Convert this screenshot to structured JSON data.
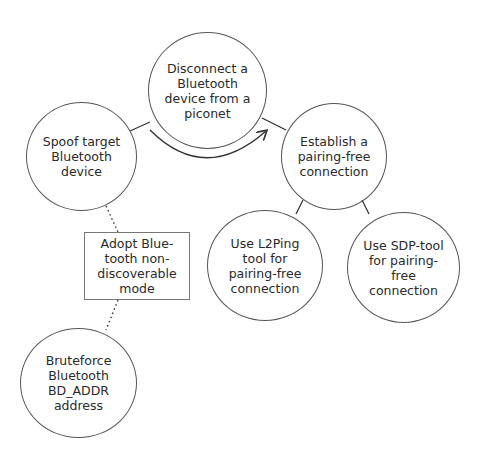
{
  "diagram": {
    "type": "attack-tree",
    "colors": {
      "stroke": "#555555",
      "text": "#2a2a2a",
      "background": "#ffffff"
    },
    "nodes": [
      {
        "id": "disconnect",
        "shape": "circle",
        "label": "Disconnect a Bluetooth device from a piconet"
      },
      {
        "id": "spoof",
        "shape": "circle",
        "label": "Spoof target Bluetooth device"
      },
      {
        "id": "establish",
        "shape": "circle",
        "label": "Establish a pairing-free connection"
      },
      {
        "id": "l2ping",
        "shape": "circle",
        "label": "Use L2Ping tool for pairing-free connection"
      },
      {
        "id": "sdp",
        "shape": "circle",
        "label": "Use SDP-tool for pairing-free connection"
      },
      {
        "id": "nondiscoverable",
        "shape": "box",
        "label": "Adopt Blue-tooth non-discoverable mode"
      },
      {
        "id": "bruteforce",
        "shape": "circle",
        "label": "Bruteforce Bluetooth BD_ADDR address"
      }
    ],
    "edges": [
      {
        "from": "spoof",
        "to": "disconnect",
        "style": "solid"
      },
      {
        "from": "disconnect",
        "to": "establish",
        "style": "solid"
      },
      {
        "from": "spoof",
        "to": "establish",
        "style": "arc-arrow"
      },
      {
        "from": "establish",
        "to": "l2ping",
        "style": "solid"
      },
      {
        "from": "establish",
        "to": "sdp",
        "style": "solid"
      },
      {
        "from": "spoof",
        "to": "nondiscoverable",
        "style": "dotted"
      },
      {
        "from": "nondiscoverable",
        "to": "bruteforce",
        "style": "dotted"
      }
    ]
  }
}
